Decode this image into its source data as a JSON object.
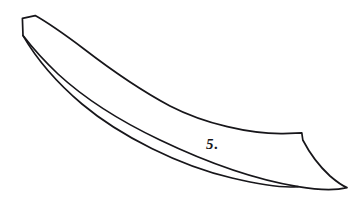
{
  "figure": {
    "label": "5.",
    "background_color": "#ffffff",
    "ink_color": "#17161a",
    "stroke_width": 1.7,
    "width": 356,
    "height": 214,
    "parts": [
      {
        "name": "tang-end",
        "description": "flat angled cut at the upper-left terminus of the blade",
        "location": "upper-left"
      },
      {
        "name": "back-edge",
        "description": "upper long concave spine curving from tang down to the right",
        "location": "upper"
      },
      {
        "name": "cutting-edge",
        "description": "lower long concave edge curving from tang down to the point",
        "location": "lower"
      },
      {
        "name": "notch-step",
        "description": "angular step where the spine drops toward the tip",
        "location": "right"
      },
      {
        "name": "point",
        "description": "blade tip at lower-right where both edges converge",
        "location": "lower-right"
      }
    ],
    "outline_path": "M 22.5 18.6 L 35.0 15.8 C 70 33 120 70 170 100 C 215 124 265 135 301.5 133.2 L 303.0 139.5 C 311 152 327 174 346.5 187.4 C 330 190 300 189 268 183 C 220 172 160 148 108 118 C 74 96 44 68 23.2 35.2 Z",
    "inner_edge_path": "M 23.2 35.2 C 48 70 84 104 126 131 C 180 165 250 184 268 183"
  }
}
